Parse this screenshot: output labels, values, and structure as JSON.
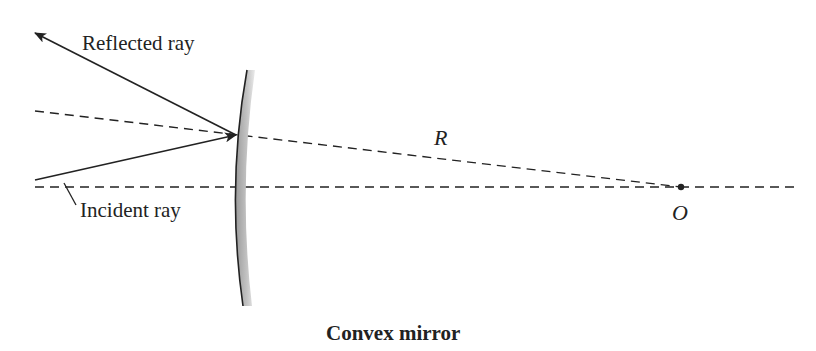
{
  "diagram": {
    "title": "Convex mirror",
    "labels": {
      "reflected_ray": "Reflected ray",
      "incident_ray": "Incident ray",
      "radius": "R",
      "center": "O"
    },
    "colors": {
      "line": "#222222",
      "mirror_fill": "#b5b5b5",
      "background": "#ffffff"
    }
  }
}
